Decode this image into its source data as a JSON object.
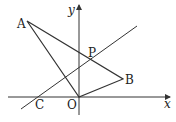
{
  "diagram": {
    "type": "coordinate-geometry",
    "axes": {
      "x_label": "x",
      "y_label": "y"
    },
    "points": {
      "A": {
        "label": "A",
        "px": [
          27,
          21
        ]
      },
      "B": {
        "label": "B",
        "px": [
          123,
          79
        ]
      },
      "O": {
        "label": "O",
        "px": [
          79,
          97
        ]
      },
      "P": {
        "label": "P",
        "px": [
          91,
          60
        ]
      },
      "C": {
        "label": "C",
        "px": [
          38,
          97
        ]
      }
    },
    "segments": [
      "AO",
      "AB",
      "OB"
    ],
    "lines": [
      "line through C and P"
    ],
    "stroke_color": "#333333"
  }
}
